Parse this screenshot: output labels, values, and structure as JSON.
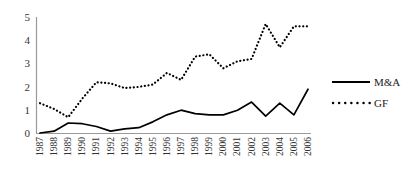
{
  "chart_data": {
    "type": "line",
    "title": "",
    "xlabel": "",
    "ylabel": "",
    "ylim": [
      0,
      5
    ],
    "yticks": [
      0,
      1,
      2,
      3,
      4,
      5
    ],
    "grid": false,
    "legend_position": "right",
    "categories": [
      "1987",
      "1988",
      "1989",
      "1990",
      "1991",
      "1992",
      "1993",
      "1994",
      "1995",
      "1996",
      "1997",
      "1998",
      "1999",
      "2000",
      "2001",
      "2002",
      "2003",
      "2004",
      "2005",
      "2006"
    ],
    "series": [
      {
        "name": "M&A",
        "style": "solid",
        "color": "#000000",
        "values": [
          0.02,
          0.1,
          0.45,
          0.42,
          0.3,
          0.1,
          0.2,
          0.25,
          0.5,
          0.8,
          1.0,
          0.85,
          0.8,
          0.8,
          1.0,
          1.35,
          0.75,
          1.3,
          0.8,
          1.9
        ]
      },
      {
        "name": "GF",
        "style": "dotted",
        "color": "#000000",
        "values": [
          1.3,
          1.05,
          0.7,
          1.5,
          2.2,
          2.15,
          1.95,
          2.0,
          2.1,
          2.6,
          2.3,
          3.3,
          3.4,
          2.8,
          3.1,
          3.2,
          4.7,
          3.7,
          4.6,
          4.6
        ]
      }
    ]
  },
  "axes": {
    "y_tick_labels": [
      "5",
      "4",
      "3",
      "2",
      "1",
      "0"
    ],
    "x_tick_labels": [
      "1987",
      "1988",
      "1989",
      "1990",
      "1991",
      "1992",
      "1993",
      "1994",
      "1995",
      "1996",
      "1997",
      "1998",
      "1999",
      "2000",
      "2001",
      "2002",
      "2003",
      "2004",
      "2005",
      "2006"
    ]
  },
  "legend": {
    "entries": [
      {
        "label": "M&A",
        "style": "solid"
      },
      {
        "label": "GF",
        "style": "dotted"
      }
    ]
  },
  "colors": {
    "axis": "#9a9a9a",
    "series": "#000000",
    "text": "#333333"
  }
}
